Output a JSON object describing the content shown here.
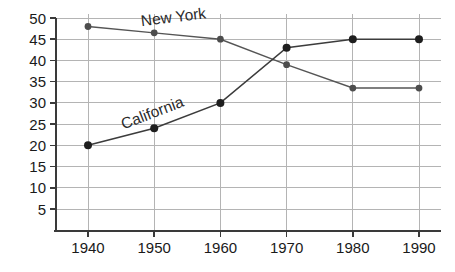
{
  "chart_data": {
    "type": "line",
    "title": "",
    "subtitle": "",
    "xlabel": "",
    "ylabel": "",
    "x": [
      1940,
      1950,
      1960,
      1970,
      1980,
      1990
    ],
    "categories": [
      "1940",
      "1950",
      "1960",
      "1970",
      "1980",
      "1990"
    ],
    "xlim": [
      1935,
      1995
    ],
    "ylim": [
      0,
      50
    ],
    "yticks": [
      5,
      10,
      15,
      20,
      25,
      30,
      35,
      40,
      45,
      50
    ],
    "ytick_labels": [
      "5",
      "10",
      "15",
      "20",
      "25",
      "30",
      "35",
      "40",
      "45",
      "50"
    ],
    "xtick_labels": [
      "1940",
      "1950",
      "1960",
      "1970",
      "1980",
      "1990"
    ],
    "grid": true,
    "grid_axis": "both",
    "legend": "inline-labels",
    "legend_position": "on-plot",
    "series": [
      {
        "name": "New York",
        "label": "New York",
        "color": "#4d4d4d",
        "values": [
          48,
          46.5,
          45,
          39,
          33.5,
          33.5
        ],
        "label_x": 1953,
        "label_y": 49,
        "label_rotation": -7
      },
      {
        "name": "California",
        "label": "California",
        "color": "#1e1e1e",
        "values": [
          20,
          24,
          30,
          43,
          45,
          45
        ],
        "label_x": 1950,
        "label_y": 26.5,
        "label_rotation": -21
      }
    ],
    "annotations": []
  },
  "axes": {
    "y_axis_name": "y-axis",
    "x_axis_name": "x-axis"
  }
}
